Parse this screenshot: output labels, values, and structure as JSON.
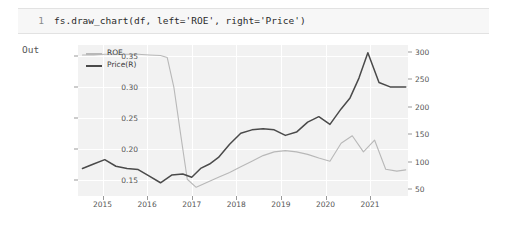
{
  "notebook": {
    "prompt_number": "1",
    "code": "fs.draw_chart(df, left='ROE', right='Price')",
    "output_label": "Out"
  },
  "chart_data": {
    "type": "line",
    "title": "",
    "xlabel": "",
    "ylabel": "",
    "grid": true,
    "legend_position": "top-left",
    "background_color": "#f2f2f2",
    "x_ticks": [
      "2015",
      "2016",
      "2017",
      "2018",
      "2019",
      "2020",
      "2021"
    ],
    "x_tick_positions": [
      2015,
      2016,
      2017,
      2018,
      2019,
      2020,
      2021
    ],
    "xlim": [
      2014.45,
      2021.85
    ],
    "left_axis": {
      "name": "ROE",
      "ticks": [
        "0.35",
        "0.30",
        "0.25",
        "0.20",
        "0.15"
      ],
      "tick_values": [
        0.35,
        0.3,
        0.25,
        0.2,
        0.15
      ],
      "ylim": [
        0.125,
        0.368
      ],
      "color": "#b8b8b8"
    },
    "right_axis": {
      "name": "Price(R)",
      "ticks": [
        "300",
        "250",
        "200",
        "150",
        "100",
        "50"
      ],
      "tick_values": [
        300,
        250,
        200,
        150,
        100,
        50
      ],
      "ylim": [
        38,
        312
      ],
      "color": "#4a4a4a"
    },
    "series": [
      {
        "name": "ROE",
        "axis": "left",
        "color": "#b8b8b8",
        "x": [
          2014.55,
          2014.8,
          2015.05,
          2015.3,
          2015.55,
          2015.8,
          2016.05,
          2016.3,
          2016.45,
          2016.6,
          2016.75,
          2016.9,
          2017.1,
          2017.35,
          2017.6,
          2017.85,
          2018.1,
          2018.35,
          2018.6,
          2018.85,
          2019.1,
          2019.35,
          2019.6,
          2019.85,
          2020.1,
          2020.35,
          2020.6,
          2020.85,
          2021.1,
          2021.35,
          2021.6,
          2021.8
        ],
        "values": [
          0.352,
          0.352,
          0.353,
          0.353,
          0.353,
          0.353,
          0.352,
          0.351,
          0.348,
          0.3,
          0.225,
          0.152,
          0.139,
          0.147,
          0.155,
          0.163,
          0.172,
          0.181,
          0.19,
          0.196,
          0.198,
          0.196,
          0.192,
          0.186,
          0.181,
          0.21,
          0.222,
          0.196,
          0.215,
          0.168,
          0.165,
          0.167
        ]
      },
      {
        "name": "Price(R)",
        "axis": "right",
        "color": "#4a4a4a",
        "x": [
          2014.55,
          2014.8,
          2015.05,
          2015.3,
          2015.55,
          2015.8,
          2016.05,
          2016.3,
          2016.55,
          2016.8,
          2017.0,
          2017.2,
          2017.4,
          2017.6,
          2017.85,
          2018.1,
          2018.35,
          2018.6,
          2018.85,
          2019.1,
          2019.35,
          2019.6,
          2019.85,
          2020.1,
          2020.35,
          2020.55,
          2020.75,
          2020.95,
          2021.2,
          2021.45,
          2021.65,
          2021.8
        ],
        "values": [
          88,
          96,
          104,
          92,
          88,
          86,
          74,
          62,
          76,
          78,
          72,
          88,
          96,
          108,
          132,
          152,
          158,
          160,
          158,
          148,
          154,
          172,
          182,
          168,
          196,
          216,
          252,
          298,
          244,
          236,
          236,
          236
        ]
      }
    ]
  }
}
